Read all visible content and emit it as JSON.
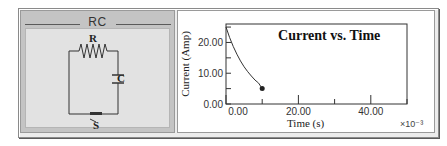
{
  "circuit_panel": {
    "title": "RC",
    "labels": {
      "resistor": "R",
      "capacitor": "C",
      "switch": "S"
    }
  },
  "chart_data": {
    "type": "line",
    "title": "Current vs. Time",
    "xlabel": "Time (s)",
    "ylabel": "Current (Amp)",
    "x_multiplier_label": "×10⁻³",
    "xlim": [
      0,
      50
    ],
    "ylim": [
      0,
      26
    ],
    "x_ticks": [
      0,
      10,
      20,
      30,
      40,
      50
    ],
    "x_tick_labels": [
      {
        "value": 0,
        "label": "0.00"
      },
      {
        "value": 20,
        "label": "20.00"
      },
      {
        "value": 40,
        "label": "40.00"
      }
    ],
    "y_ticks": [
      0,
      5,
      10,
      15,
      20,
      25
    ],
    "y_tick_labels": [
      {
        "value": 0,
        "label": "0.00"
      },
      {
        "value": 10,
        "label": "10.00"
      },
      {
        "value": 20,
        "label": "20.00"
      }
    ],
    "series": [
      {
        "name": "Current",
        "color": "#333333",
        "x": [
          0,
          1,
          2,
          3,
          4,
          5,
          6,
          7,
          8,
          9,
          10
        ],
        "y": [
          25.0,
          21.6,
          18.7,
          16.2,
          14.0,
          12.1,
          10.5,
          9.1,
          7.8,
          6.8,
          5.0
        ]
      }
    ],
    "marker": {
      "x": 10,
      "y": 5.0
    },
    "grid": false
  }
}
